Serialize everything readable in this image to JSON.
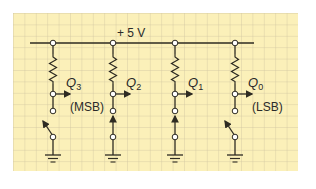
{
  "diagram": {
    "supply_label": "+ 5 V",
    "colors": {
      "background": "#fbf0b9",
      "grid_line": "#c9bd9a",
      "wire": "#2e2b22",
      "node_fill": "#ffffff"
    },
    "bits": [
      {
        "name": "Q",
        "sub": "3",
        "tag": "(MSB)",
        "switch_state": "open"
      },
      {
        "name": "Q",
        "sub": "2",
        "tag": "",
        "switch_state": "closed"
      },
      {
        "name": "Q",
        "sub": "1",
        "tag": "",
        "switch_state": "closed"
      },
      {
        "name": "Q",
        "sub": "0",
        "tag": "(LSB)",
        "switch_state": "open"
      }
    ]
  }
}
